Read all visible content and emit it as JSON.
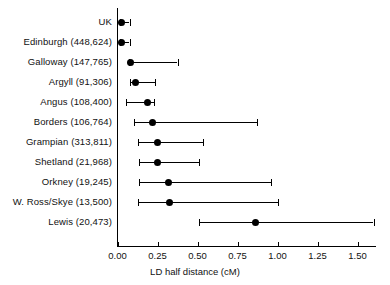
{
  "chart_data": {
    "type": "scatter",
    "title": "",
    "xlabel": "LD half distance (cM)",
    "ylabel": "",
    "xlim": [
      0.0,
      1.64
    ],
    "grid": false,
    "legend": "none",
    "xticks": [
      0.0,
      0.25,
      0.5,
      0.75,
      1.0,
      1.25,
      1.5
    ],
    "xticklabels": [
      "0.00",
      "0.25",
      "0.50",
      "0.75",
      "1.00",
      "1.25",
      "1.50"
    ],
    "categories": [
      "UK",
      "Edinburgh (448,624)",
      "Galloway (147,765)",
      "Argyll (91,306)",
      "Angus (108,400)",
      "Borders (106,764)",
      "Grampian (313,811)",
      "Shetland (21,968)",
      "Orkney (19,245)",
      "W. Ross/Skye (13,500)",
      "Lewis (20,473)"
    ],
    "points": [
      {
        "label": "UK",
        "value": 0.025,
        "low": 0.018,
        "high": 0.075
      },
      {
        "label": "Edinburgh (448,624)",
        "value": 0.025,
        "low": 0.018,
        "high": 0.075
      },
      {
        "label": "Galloway (147,765)",
        "value": 0.08,
        "low": 0.07,
        "high": 0.375
      },
      {
        "label": "Argyll (91,306)",
        "value": 0.115,
        "low": 0.075,
        "high": 0.235
      },
      {
        "label": "Angus (108,400)",
        "value": 0.19,
        "low": 0.05,
        "high": 0.23
      },
      {
        "label": "Borders (106,764)",
        "value": 0.22,
        "low": 0.1,
        "high": 0.87
      },
      {
        "label": "Grampian (313,811)",
        "value": 0.25,
        "low": 0.125,
        "high": 0.535
      },
      {
        "label": "Shetland (21,968)",
        "value": 0.25,
        "low": 0.135,
        "high": 0.51
      },
      {
        "label": "Orkney (19,245)",
        "value": 0.32,
        "low": 0.135,
        "high": 0.96
      },
      {
        "label": "W. Ross/Skye (13,500)",
        "value": 0.325,
        "low": 0.13,
        "high": 1.005
      },
      {
        "label": "Lewis (20,473)",
        "value": 0.865,
        "low": 0.51,
        "high": 1.6
      }
    ]
  },
  "axis": {
    "x_title": "LD half distance (cM)"
  }
}
